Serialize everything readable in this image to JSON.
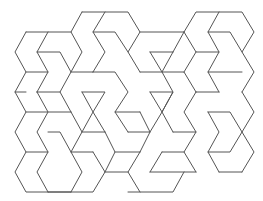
{
  "figure": {
    "stroke_color": "#555555",
    "background": "#ffffff",
    "polylines": [
      [
        [
          82,
          12
        ],
        [
          128,
          12
        ],
        [
          140,
          32
        ],
        [
          128,
          52
        ],
        [
          140,
          72
        ]
      ],
      [
        [
          82,
          12
        ],
        [
          71,
          32
        ],
        [
          82,
          52
        ],
        [
          71,
          72
        ]
      ],
      [
        [
          105,
          12
        ],
        [
          93,
          32
        ],
        [
          105,
          52
        ],
        [
          93,
          72
        ]
      ],
      [
        [
          26,
          32
        ],
        [
          71,
          32
        ]
      ],
      [
        [
          48,
          32
        ],
        [
          37,
          52
        ],
        [
          48,
          72
        ],
        [
          37,
          92
        ]
      ],
      [
        [
          26,
          32
        ],
        [
          15,
          52
        ],
        [
          26,
          72
        ],
        [
          15,
          92
        ],
        [
          26,
          112
        ],
        [
          15,
          132
        ],
        [
          26,
          152
        ],
        [
          15,
          172
        ],
        [
          26,
          192
        ],
        [
          71,
          192
        ]
      ],
      [
        [
          37,
          52
        ],
        [
          60,
          52
        ],
        [
          71,
          72
        ],
        [
          60,
          92
        ],
        [
          71,
          112
        ]
      ],
      [
        [
          93,
          32
        ],
        [
          115,
          32
        ],
        [
          128,
          52
        ]
      ],
      [
        [
          93,
          72
        ],
        [
          115,
          72
        ],
        [
          128,
          92
        ],
        [
          115,
          112
        ],
        [
          128,
          132
        ]
      ],
      [
        [
          26,
          72
        ],
        [
          48,
          72
        ]
      ],
      [
        [
          71,
          72
        ],
        [
          93,
          72
        ]
      ],
      [
        [
          140,
          32
        ],
        [
          184,
          32
        ]
      ],
      [
        [
          184,
          32
        ],
        [
          196,
          12
        ],
        [
          242,
          12
        ],
        [
          254,
          32
        ],
        [
          242,
          52
        ],
        [
          254,
          72
        ],
        [
          242,
          92
        ]
      ],
      [
        [
          219,
          12
        ],
        [
          208,
          32
        ],
        [
          219,
          52
        ],
        [
          208,
          72
        ],
        [
          219,
          92
        ]
      ],
      [
        [
          208,
          32
        ],
        [
          230,
          32
        ],
        [
          242,
          52
        ]
      ],
      [
        [
          173,
          52
        ],
        [
          162,
          72
        ],
        [
          173,
          92
        ],
        [
          162,
          112
        ]
      ],
      [
        [
          184,
          32
        ],
        [
          173,
          52
        ]
      ],
      [
        [
          150,
          52
        ],
        [
          173,
          52
        ]
      ],
      [
        [
          150,
          52
        ],
        [
          162,
          72
        ]
      ],
      [
        [
          140,
          72
        ],
        [
          184,
          72
        ],
        [
          196,
          92
        ]
      ],
      [
        [
          196,
          52
        ],
        [
          184,
          72
        ]
      ],
      [
        [
          184,
          32
        ],
        [
          196,
          52
        ],
        [
          219,
          52
        ]
      ],
      [
        [
          208,
          72
        ],
        [
          242,
          72
        ]
      ],
      [
        [
          15,
          92
        ],
        [
          26,
          92
        ]
      ],
      [
        [
          37,
          92
        ],
        [
          60,
          92
        ]
      ],
      [
        [
          37,
          92
        ],
        [
          48,
          112
        ],
        [
          37,
          132
        ],
        [
          48,
          152
        ],
        [
          37,
          172
        ],
        [
          48,
          192
        ]
      ],
      [
        [
          26,
          112
        ],
        [
          71,
          112
        ]
      ],
      [
        [
          71,
          112
        ],
        [
          82,
          132
        ],
        [
          71,
          152
        ],
        [
          82,
          172
        ],
        [
          71,
          192
        ]
      ],
      [
        [
          82,
          92
        ],
        [
          93,
          112
        ],
        [
          82,
          132
        ]
      ],
      [
        [
          82,
          92
        ],
        [
          105,
          92
        ],
        [
          93,
          112
        ],
        [
          105,
          132
        ]
      ],
      [
        [
          115,
          112
        ],
        [
          140,
          112
        ]
      ],
      [
        [
          140,
          112
        ],
        [
          150,
          132
        ],
        [
          140,
          152
        ]
      ],
      [
        [
          150,
          92
        ],
        [
          162,
          112
        ],
        [
          150,
          132
        ]
      ],
      [
        [
          150,
          92
        ],
        [
          173,
          92
        ],
        [
          162,
          112
        ],
        [
          173,
          132
        ]
      ],
      [
        [
          196,
          92
        ],
        [
          184,
          112
        ],
        [
          196,
          132
        ],
        [
          184,
          152
        ],
        [
          196,
          172
        ]
      ],
      [
        [
          196,
          92
        ],
        [
          219,
          92
        ]
      ],
      [
        [
          242,
          92
        ],
        [
          254,
          112
        ],
        [
          242,
          132
        ],
        [
          254,
          152
        ],
        [
          242,
          172
        ]
      ],
      [
        [
          208,
          112
        ],
        [
          230,
          112
        ],
        [
          242,
          132
        ]
      ],
      [
        [
          208,
          112
        ],
        [
          219,
          132
        ],
        [
          208,
          152
        ],
        [
          219,
          172
        ]
      ],
      [
        [
          26,
          152
        ],
        [
          48,
          152
        ]
      ],
      [
        [
          48,
          132
        ],
        [
          60,
          132
        ],
        [
          71,
          152
        ]
      ],
      [
        [
          82,
          132
        ],
        [
          105,
          132
        ]
      ],
      [
        [
          105,
          132
        ],
        [
          115,
          152
        ],
        [
          105,
          172
        ]
      ],
      [
        [
          128,
          132
        ],
        [
          150,
          132
        ]
      ],
      [
        [
          173,
          132
        ],
        [
          196,
          132
        ]
      ],
      [
        [
          71,
          152
        ],
        [
          93,
          152
        ]
      ],
      [
        [
          93,
          152
        ],
        [
          105,
          172
        ],
        [
          93,
          192
        ],
        [
          48,
          192
        ]
      ],
      [
        [
          115,
          152
        ],
        [
          140,
          152
        ]
      ],
      [
        [
          140,
          152
        ],
        [
          128,
          172
        ],
        [
          140,
          192
        ]
      ],
      [
        [
          150,
          172
        ],
        [
          196,
          172
        ]
      ],
      [
        [
          162,
          152
        ],
        [
          184,
          152
        ]
      ],
      [
        [
          162,
          152
        ],
        [
          150,
          172
        ]
      ],
      [
        [
          208,
          152
        ],
        [
          230,
          152
        ],
        [
          242,
          132
        ]
      ],
      [
        [
          219,
          172
        ],
        [
          242,
          172
        ]
      ],
      [
        [
          105,
          172
        ],
        [
          128,
          172
        ]
      ],
      [
        [
          128,
          192
        ],
        [
          173,
          192
        ],
        [
          184,
          172
        ]
      ]
    ]
  }
}
